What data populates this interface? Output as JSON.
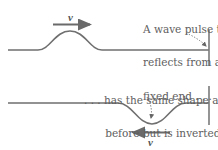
{
  "top_panel": {
    "caption_lines": [
      "A wave pulse that",
      "reflects from a",
      "fixed end . . ."
    ],
    "velocity_label": "v",
    "velocity_direction": "right",
    "pulse": "upright"
  },
  "bottom_panel": {
    "caption_lines": [
      ". . . has the same shape as",
      "before but is inverted."
    ],
    "velocity_label": "v",
    "velocity_direction": "left",
    "pulse": "inverted"
  },
  "colors": {
    "string": "#6f6f6f",
    "wall": "#7a7a7a",
    "arrow": "#6a6a6a",
    "text": "#5e5e5e"
  }
}
